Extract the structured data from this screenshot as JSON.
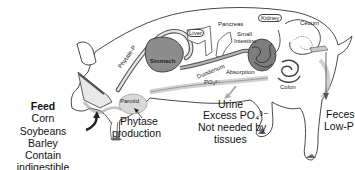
{
  "diagram": {
    "organ_labels": {
      "liver": "Liver",
      "pancreas": "Pancreas",
      "kidney": "Kidney",
      "cecum": "Cecum",
      "small_intestine_line1": "Small",
      "small_intestine_line2": "Intestine",
      "stomach": "Stomach",
      "duodenum": "Duodenum",
      "duodenum_po4": "PO₄³⁻",
      "absorption": "Absorption",
      "colon": "Colon",
      "parotid": "Parotid",
      "phytate_p_arrow": "Phytate-P"
    },
    "annotations": {
      "phytase_line1": "Phytase",
      "phytase_line2": "production",
      "urine_line1": "Urine",
      "urine_line2": "Excess PO₄³⁻",
      "urine_line3": "Not needed by",
      "urine_line4": "tissues",
      "feces_line1": "Feces",
      "feces_line2": "Low-P"
    },
    "feed": {
      "title": "Feed",
      "items": [
        "Corn",
        "Soybeans",
        "Barley",
        "Contain indigestible",
        "Phytate - P"
      ]
    },
    "colors": {
      "outline": "#333333",
      "tract_gray": "#9a9a9a",
      "stomach_fill": "#8c8c8c",
      "shadow_gray": "#cfcfcf",
      "background": "#ffffff"
    }
  }
}
